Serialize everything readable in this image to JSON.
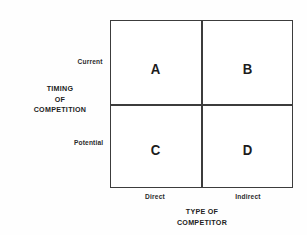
{
  "chart_data": {
    "type": "table",
    "title": "",
    "xlabel": "TYPE OF COMPETITOR",
    "ylabel": "TIMING OF COMPETITION",
    "x_categories": [
      "Direct",
      "Indirect"
    ],
    "y_categories": [
      "Current",
      "Potential"
    ],
    "grid": true,
    "legend": "none",
    "cells": [
      {
        "row": "Current",
        "column": "Direct",
        "label": "A"
      },
      {
        "row": "Current",
        "column": "Indirect",
        "label": "B"
      },
      {
        "row": "Potential",
        "column": "Direct",
        "label": "C"
      },
      {
        "row": "Potential",
        "column": "Indirect",
        "label": "D"
      }
    ],
    "colors": {
      "background": "#ffffff",
      "border": "#3c3c3c",
      "text": "#1c1c1c"
    }
  },
  "matrix": {
    "quadrants": {
      "a": "A",
      "b": "B",
      "c": "C",
      "d": "D"
    }
  },
  "y_axis": {
    "title_line1": "TIMING",
    "title_line2": "OF",
    "title_line3": "COMPETITION",
    "tick_top": "Current",
    "tick_bottom": "Potential"
  },
  "x_axis": {
    "title_line1": "TYPE OF",
    "title_line2": "COMPETITOR",
    "tick_left": "Direct",
    "tick_right": "Indirect"
  }
}
